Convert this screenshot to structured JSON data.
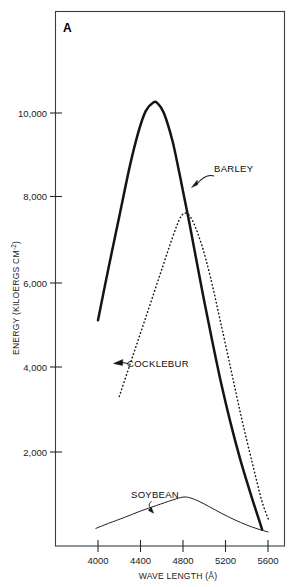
{
  "figure": {
    "panel_label": "A",
    "background_color": "#ffffff",
    "ink_color": "#141414"
  },
  "chart_data": {
    "type": "line",
    "title": "",
    "panel": "A",
    "xlabel": "WAVE LENGTH (Å)",
    "ylabel": "ENERGY (KILOERGS CM-2)",
    "ylabel_main": "ENERGY (KILOERGS CM",
    "ylabel_exponent": "-2",
    "ylabel_tail": ")",
    "xlim": [
      3860,
      5745
    ],
    "ylim": [
      0,
      12750
    ],
    "grid": false,
    "legend": "inline-annotations",
    "xticks": [
      4000,
      4400,
      4800,
      5200,
      5600
    ],
    "xtick_labels": [
      "4000",
      "4400",
      "4800",
      "5200",
      "5600"
    ],
    "yticks": [
      2000,
      4000,
      6000,
      8000,
      10000
    ],
    "ytick_labels": [
      "2,000",
      "4,000",
      "6,000",
      "8,000",
      "10,000"
    ],
    "series": [
      {
        "name": "BARLEY",
        "style": "solid-thick",
        "color": "#141414",
        "x": [
          4000,
          4100,
          4200,
          4300,
          4380,
          4450,
          4520,
          4560,
          4620,
          4700,
          4760,
          4800,
          4860,
          4920,
          5000,
          5080,
          5160,
          5250,
          5340,
          5430,
          5500,
          5545
        ],
        "y": [
          5100,
          6350,
          7550,
          8750,
          9550,
          10050,
          10250,
          10230,
          10000,
          9350,
          8650,
          8150,
          7400,
          6600,
          5550,
          4550,
          3600,
          2650,
          1800,
          1050,
          500,
          150
        ]
      },
      {
        "name": "COCKLEBUR",
        "style": "dotted",
        "color": "#141414",
        "x": [
          4200,
          4300,
          4400,
          4500,
          4600,
          4700,
          4780,
          4840,
          4900,
          4980,
          5060,
          5150,
          5250,
          5350,
          5450,
          5540,
          5610
        ],
        "y": [
          3300,
          4050,
          4800,
          5550,
          6300,
          7050,
          7550,
          7620,
          7400,
          6850,
          6100,
          5100,
          3950,
          2800,
          1750,
          850,
          350
        ]
      },
      {
        "name": "SOYBEAN",
        "style": "solid-thin",
        "color": "#141414",
        "x": [
          3980,
          4100,
          4250,
          4400,
          4550,
          4700,
          4800,
          4870,
          4950,
          5050,
          5160,
          5280,
          5400,
          5500,
          5600
        ],
        "y": [
          180,
          300,
          440,
          590,
          720,
          850,
          920,
          900,
          820,
          690,
          540,
          390,
          260,
          170,
          95
        ]
      }
    ],
    "annotations": [
      {
        "label": "BARLEY",
        "target_x": 5020,
        "target_y": 8550,
        "text_x": 5180,
        "text_y": 9600
      },
      {
        "label": "COCKLEBUR",
        "target_x": 4410,
        "target_y": 4650,
        "text_x": 4480,
        "text_y": 4450
      },
      {
        "label": "SOYBEAN",
        "target_x": 4600,
        "target_y": 1150,
        "text_x": 4560,
        "text_y": 1700
      }
    ]
  },
  "axis": {
    "x_title": "WAVE LENGTH (Å)",
    "y_title_main": "ENERGY (KILOERGS CM",
    "y_title_exp": "-2",
    "y_title_close": ")",
    "x_tick_labels": [
      "4000",
      "4400",
      "4800",
      "5200",
      "5600"
    ],
    "y_tick_labels": [
      "10,000",
      "8,000",
      "6,000",
      "4,000",
      "2,000"
    ]
  },
  "labels": {
    "barley": "BARLEY",
    "cocklebur": "COCKLEBUR",
    "soybean": "SOYBEAN",
    "panel": "A"
  }
}
